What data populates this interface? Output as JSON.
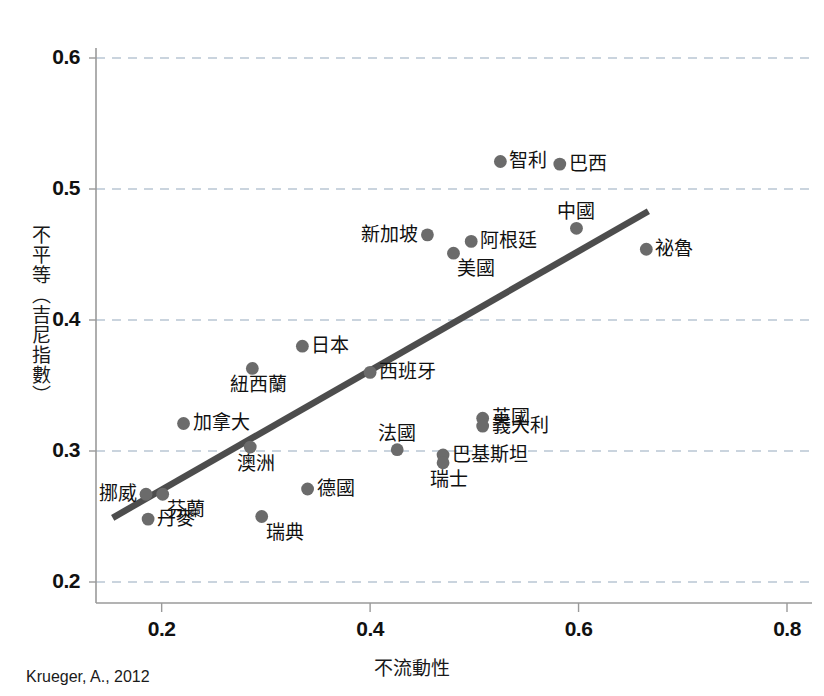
{
  "source_note": "Krueger, A., 2012",
  "chart_data": {
    "type": "scatter",
    "title": "",
    "xlabel": "不流動性",
    "ylabel": "不平等（吉尼指數）",
    "xlim": [
      0.137,
      0.83
    ],
    "ylim": [
      0.185,
      0.615
    ],
    "xticks": [
      "0.2",
      "0.4",
      "0.6",
      "0.8"
    ],
    "xtick_values": [
      0.2,
      0.4,
      0.6,
      0.8
    ],
    "yticks": [
      "0.2",
      "0.3",
      "0.4",
      "0.5",
      "0.6"
    ],
    "ytick_values": [
      0.2,
      0.3,
      0.4,
      0.5,
      0.6
    ],
    "grid": "horizontal-dashed",
    "legend": "none",
    "point_color": "#6b6b6b",
    "trendline_color": "#4d4d4d",
    "grid_color": "#b9c6d4",
    "axis_color": "#9a9a9a",
    "trendline": {
      "x0": 0.153,
      "y0": 0.249,
      "x1": 0.667,
      "y1": 0.483
    },
    "points": [
      {
        "label": "智利",
        "x": 0.525,
        "y": 0.521,
        "label_pos": "right"
      },
      {
        "label": "巴西",
        "x": 0.582,
        "y": 0.519,
        "label_pos": "right"
      },
      {
        "label": "中國",
        "x": 0.598,
        "y": 0.47,
        "label_pos": "above"
      },
      {
        "label": "新加坡",
        "x": 0.455,
        "y": 0.465,
        "label_pos": "left"
      },
      {
        "label": "阿根廷",
        "x": 0.497,
        "y": 0.46,
        "label_pos": "right"
      },
      {
        "label": "美國",
        "x": 0.48,
        "y": 0.451,
        "label_pos": "below-right"
      },
      {
        "label": "祕魯",
        "x": 0.665,
        "y": 0.454,
        "label_pos": "right"
      },
      {
        "label": "日本",
        "x": 0.335,
        "y": 0.38,
        "label_pos": "right"
      },
      {
        "label": "西班牙",
        "x": 0.4,
        "y": 0.36,
        "label_pos": "right"
      },
      {
        "label": "紐西蘭",
        "x": 0.287,
        "y": 0.363,
        "label_pos": "below"
      },
      {
        "label": "英國",
        "x": 0.508,
        "y": 0.325,
        "label_pos": "right"
      },
      {
        "label": "義大利",
        "x": 0.508,
        "y": 0.319,
        "label_pos": "right"
      },
      {
        "label": "加拿大",
        "x": 0.221,
        "y": 0.321,
        "label_pos": "right"
      },
      {
        "label": "法國",
        "x": 0.426,
        "y": 0.301,
        "label_pos": "above"
      },
      {
        "label": "澳洲",
        "x": 0.285,
        "y": 0.303,
        "label_pos": "below"
      },
      {
        "label": "巴基斯坦",
        "x": 0.47,
        "y": 0.297,
        "label_pos": "right"
      },
      {
        "label": "瑞士",
        "x": 0.47,
        "y": 0.291,
        "label_pos": "below"
      },
      {
        "label": "德國",
        "x": 0.34,
        "y": 0.271,
        "label_pos": "right"
      },
      {
        "label": "挪威",
        "x": 0.185,
        "y": 0.267,
        "label_pos": "left"
      },
      {
        "label": "芬蘭",
        "x": 0.201,
        "y": 0.267,
        "label_pos": "below-right"
      },
      {
        "label": "瑞典",
        "x": 0.296,
        "y": 0.25,
        "label_pos": "below-right"
      },
      {
        "label": "丹麥",
        "x": 0.187,
        "y": 0.248,
        "label_pos": "right"
      }
    ]
  }
}
